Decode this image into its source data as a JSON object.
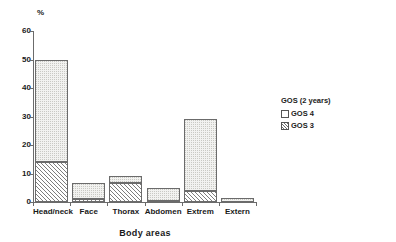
{
  "chart_data": {
    "type": "bar",
    "subtype": "stacked-bar",
    "title": "",
    "xlabel": "Body areas",
    "ylabel": "%",
    "ylim": [
      0,
      60
    ],
    "yticks": [
      0,
      10,
      20,
      30,
      40,
      50,
      60
    ],
    "grid": false,
    "legend_position": "right",
    "legend_title": "GOS (2 years)",
    "categories": [
      "Head/neck",
      "Face",
      "Thorax",
      "Abdomen",
      "Extrem",
      "Extern"
    ],
    "series": [
      {
        "name": "GOS 3",
        "fill": "diagonal-hatch",
        "values": [
          14,
          1,
          6.7,
          0.5,
          4,
          0
        ]
      },
      {
        "name": "GOS 4",
        "fill": "fine-dotted",
        "values": [
          36,
          5.5,
          2.3,
          4.5,
          25,
          1.3
        ]
      }
    ],
    "totals": [
      50,
      6.5,
      9,
      5,
      29,
      1.3
    ]
  },
  "axes": {
    "y_unit_label": "%",
    "y_tick_labels": [
      "60",
      "50",
      "40",
      "30",
      "20",
      "10",
      "0"
    ],
    "x_tick_labels": [
      "Head/neck",
      "Face",
      "Thorax",
      "Abdomen",
      "Extrem",
      "Extern"
    ],
    "x_axis_title": "Body areas"
  },
  "legend": {
    "title": "GOS (2 years)",
    "items": [
      {
        "label": "GOS 4",
        "swatch": "empty-square-icon"
      },
      {
        "label": "GOS 3",
        "swatch": "hatched-square-icon"
      }
    ]
  },
  "colors": {
    "axis": "#6b6b6b",
    "text": "#1a1a1a",
    "gos4_fill": "#f2f2f0",
    "gos3_hatch": "#7d7d7d",
    "background": "#ffffff"
  }
}
